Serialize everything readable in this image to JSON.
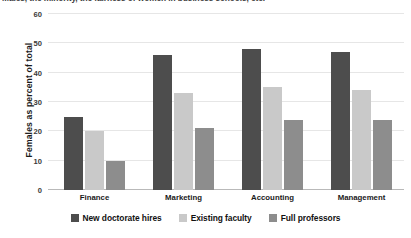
{
  "chart_data": {
    "type": "bar",
    "title": "Males, the minority, the fairness of women in business schools, etc.",
    "xlabel": "",
    "ylabel": "Females as percent of total",
    "categories": [
      "Finance",
      "Marketing",
      "Accounting",
      "Management"
    ],
    "series": [
      {
        "name": "New doctorate hires",
        "color": "#4d4d4d",
        "values": [
          25,
          46,
          48,
          47
        ]
      },
      {
        "name": "Existing faculty",
        "color": "#c9c9c9",
        "values": [
          20,
          33,
          35,
          34
        ]
      },
      {
        "name": "Full professors",
        "color": "#8d8d8d",
        "values": [
          10,
          21,
          24,
          24
        ]
      }
    ],
    "ylim": [
      0,
      60
    ],
    "yticks": [
      0,
      10,
      20,
      30,
      40,
      50,
      60
    ],
    "ytick_labels": [
      "0",
      "10",
      "20",
      "30",
      "40",
      "50",
      "60"
    ],
    "grid": true,
    "legend_position": "bottom"
  }
}
